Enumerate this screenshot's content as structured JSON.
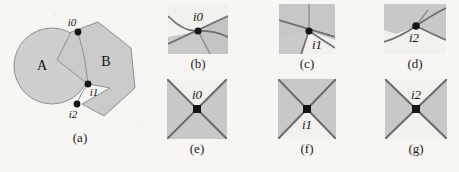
{
  "figure": {
    "background_color": "#f7f6f3",
    "shape_fill": "#c9c9c9",
    "shape_stroke": "#8a8a8a",
    "line_color": "#6b6b6b",
    "vertex_color": "#121212",
    "text_color": "#141414"
  },
  "panel_a": {
    "caption": "(a)",
    "region_labels": [
      {
        "text": "A",
        "x": 42,
        "y": 64
      },
      {
        "text": "B",
        "x": 105,
        "y": 62
      }
    ],
    "intersection_points": [
      {
        "id": "i0",
        "label": "i0",
        "x": 78,
        "y": 32,
        "label_x": 72,
        "label_y": 24
      },
      {
        "id": "i1",
        "label": "i1",
        "x": 88,
        "y": 84,
        "label_x": 92,
        "label_y": 94
      },
      {
        "id": "i2",
        "label": "i2",
        "x": 77,
        "y": 104,
        "label_x": 72,
        "label_y": 118
      }
    ],
    "circle": {
      "cx": 52,
      "cy": 66,
      "r": 38
    },
    "polygon_points": "98,22 131,48 135,88 104,116 82,104 110,88 88,84 57,60 71,32"
  },
  "panels_top": [
    {
      "id": "b",
      "caption": "(b)",
      "vertex_label": "i0",
      "vertex": {
        "x": 30,
        "y": 27
      },
      "label_pos": {
        "x": 30,
        "y": 17
      }
    },
    {
      "id": "c",
      "caption": "(c)",
      "vertex_label": "i1",
      "vertex": {
        "x": 30,
        "y": 27
      },
      "label_pos": {
        "x": 38,
        "y": 41
      }
    },
    {
      "id": "d",
      "caption": "(d)",
      "vertex_label": "i2",
      "vertex": {
        "x": 32,
        "y": 22
      },
      "label_pos": {
        "x": 30,
        "y": 38
      }
    }
  ],
  "panels_bottom": [
    {
      "id": "e",
      "caption": "(e)",
      "vertex_label": "i0",
      "vertex": {
        "x": 30,
        "y": 30
      },
      "label_pos": {
        "x": 30,
        "y": 18
      },
      "shaded_sectors": [
        "left",
        "right",
        "bottom"
      ]
    },
    {
      "id": "f",
      "caption": "(f)",
      "vertex_label": "i1",
      "vertex": {
        "x": 30,
        "y": 30
      },
      "label_pos": {
        "x": 30,
        "y": 48
      },
      "shaded_sectors": [
        "left",
        "right",
        "top"
      ]
    },
    {
      "id": "g",
      "caption": "(g)",
      "vertex_label": "i2",
      "vertex": {
        "x": 30,
        "y": 30
      },
      "label_pos": {
        "x": 30,
        "y": 18
      },
      "shaded_sectors": [
        "left",
        "right"
      ]
    }
  ]
}
